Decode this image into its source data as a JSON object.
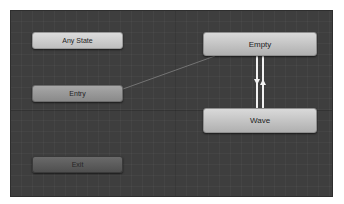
{
  "animator": {
    "nodes": {
      "any_state": {
        "label": "Any State"
      },
      "entry": {
        "label": "Entry"
      },
      "exit": {
        "label": "Exit"
      },
      "empty": {
        "label": "Empty"
      },
      "wave": {
        "label": "Wave"
      }
    },
    "transitions": [
      {
        "from": "Entry",
        "to": "Empty",
        "type": "default"
      },
      {
        "from": "Empty",
        "to": "Wave"
      },
      {
        "from": "Wave",
        "to": "Empty"
      }
    ],
    "colors": {
      "canvas": "#3e3e3e",
      "state_node": "#c4c4c4",
      "entry_node": "#999999",
      "exit_node": "#5c5c5c",
      "transition": "#f2f2f2",
      "default_transition": "#8a8a8a"
    }
  }
}
